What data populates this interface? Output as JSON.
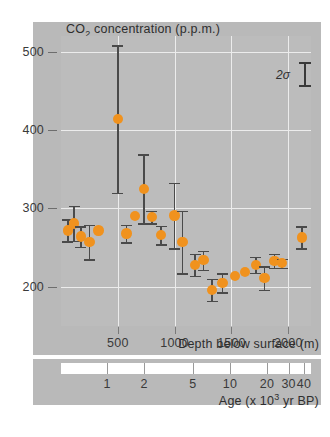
{
  "chart_data": {
    "type": "scatter",
    "title": "CO2 concentration (p.p.m.)",
    "title_parts": {
      "pre": "CO",
      "sub": "2",
      "post": " concentration (p.p.m.)"
    },
    "xlabel": "Depth below surface (m)",
    "xlabel2": "Age (x 103 yr BP)",
    "xlabel2_parts": {
      "pre": "Age (x 10",
      "sup": "3",
      "post": " yr BP)"
    },
    "ylabel": "CO2 concentration (p.p.m.)",
    "ylim": [
      150,
      520
    ],
    "xlim": [
      0,
      2200
    ],
    "yticks": [
      200,
      300,
      400,
      500
    ],
    "xticks": [
      500,
      1000,
      1500,
      2000
    ],
    "xtick_labels": [
      "500",
      "1000",
      "1500",
      "2000"
    ],
    "grid": true,
    "age_ticks": [
      1,
      2,
      5,
      10,
      20,
      30,
      40
    ],
    "age_tick_labels": [
      "1",
      "2",
      "5",
      "10",
      "20",
      "30",
      "40"
    ],
    "legend": {
      "label": "2σ",
      "position": "top-right"
    },
    "colors": {
      "marker": "#f0921e",
      "errorbar": "#4a4a4a",
      "panel": "#b9b9b9",
      "plot": "#bcbcbc",
      "grid": "#ececec"
    },
    "points": [
      {
        "depth": 60,
        "co2": 272,
        "err": 14
      },
      {
        "depth": 115,
        "co2": 281,
        "err": 22
      },
      {
        "depth": 175,
        "co2": 264,
        "err": 13
      },
      {
        "depth": 250,
        "co2": 257,
        "err": 22
      },
      {
        "depth": 330,
        "co2": 272,
        "err": 0
      },
      {
        "depth": 500,
        "co2": 414,
        "err": 94
      },
      {
        "depth": 575,
        "co2": 268,
        "err": 11
      },
      {
        "depth": 650,
        "co2": 290,
        "err": 0
      },
      {
        "depth": 730,
        "co2": 325,
        "err": 44
      },
      {
        "depth": 800,
        "co2": 289,
        "err": 8
      },
      {
        "depth": 880,
        "co2": 266,
        "err": 12
      },
      {
        "depth": 1000,
        "co2": 291,
        "err": 42
      },
      {
        "depth": 1070,
        "co2": 257,
        "err": 40
      },
      {
        "depth": 1180,
        "co2": 228,
        "err": 14
      },
      {
        "depth": 1255,
        "co2": 234,
        "err": 12
      },
      {
        "depth": 1330,
        "co2": 196,
        "err": 14
      },
      {
        "depth": 1420,
        "co2": 205,
        "err": 12
      },
      {
        "depth": 1530,
        "co2": 214,
        "err": 0
      },
      {
        "depth": 1620,
        "co2": 219,
        "err": 0
      },
      {
        "depth": 1715,
        "co2": 228,
        "err": 10
      },
      {
        "depth": 1790,
        "co2": 211,
        "err": 15
      },
      {
        "depth": 1880,
        "co2": 233,
        "err": 9
      },
      {
        "depth": 1945,
        "co2": 230,
        "err": 6
      },
      {
        "depth": 2120,
        "co2": 263,
        "err": 14
      }
    ]
  }
}
